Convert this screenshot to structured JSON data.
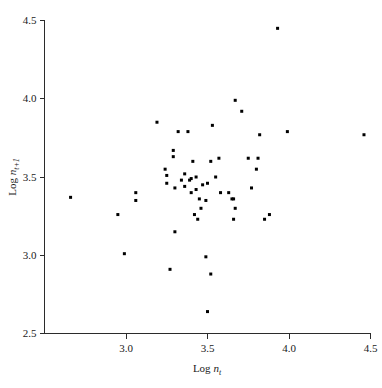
{
  "chart_data": {
    "type": "scatter",
    "title": "",
    "xlabel": "Log n_t",
    "ylabel": "Log n_t+1",
    "xlabel_parts": {
      "prefix": "Log ",
      "symbol": "n",
      "subscript": "t"
    },
    "ylabel_parts": {
      "prefix": "Log ",
      "symbol": "n",
      "subscript": "t+1"
    },
    "xlim": [
      2.5,
      4.5
    ],
    "ylim": [
      2.5,
      4.5
    ],
    "xticks": [
      "3.0",
      "3.5",
      "4.0",
      "4.5"
    ],
    "xtick_values": [
      3.0,
      3.5,
      4.0,
      4.5
    ],
    "yticks": [
      "2.5",
      "3.0",
      "3.5",
      "4.0",
      "4.5"
    ],
    "ytick_values": [
      2.5,
      3.0,
      3.5,
      4.0,
      4.5
    ],
    "grid": false,
    "legend": false,
    "marker": "square",
    "marker_color": "#000000",
    "marker_size_px": 3,
    "n_points": 57,
    "points": [
      [
        2.66,
        3.37
      ],
      [
        2.95,
        3.26
      ],
      [
        2.99,
        3.01
      ],
      [
        3.06,
        3.4
      ],
      [
        3.06,
        3.35
      ],
      [
        3.19,
        3.85
      ],
      [
        3.25,
        3.51
      ],
      [
        3.25,
        3.46
      ],
      [
        3.27,
        2.91
      ],
      [
        3.29,
        3.67
      ],
      [
        3.29,
        3.63
      ],
      [
        3.3,
        3.15
      ],
      [
        3.32,
        3.79
      ],
      [
        3.38,
        3.79
      ],
      [
        3.39,
        3.48
      ],
      [
        3.4,
        3.4
      ],
      [
        3.41,
        3.6
      ],
      [
        3.42,
        3.26
      ],
      [
        3.44,
        3.23
      ],
      [
        3.47,
        3.45
      ],
      [
        3.49,
        2.99
      ],
      [
        3.5,
        3.46
      ],
      [
        3.5,
        2.64
      ],
      [
        3.52,
        3.6
      ],
      [
        3.52,
        2.88
      ],
      [
        3.53,
        3.83
      ],
      [
        3.57,
        3.62
      ],
      [
        3.65,
        3.36
      ],
      [
        3.66,
        3.36
      ],
      [
        3.66,
        3.23
      ],
      [
        3.67,
        3.99
      ],
      [
        3.67,
        3.3
      ],
      [
        3.71,
        3.92
      ],
      [
        3.75,
        3.62
      ],
      [
        3.77,
        3.43
      ],
      [
        3.8,
        3.55
      ],
      [
        3.81,
        3.62
      ],
      [
        3.82,
        3.77
      ],
      [
        3.85,
        3.23
      ],
      [
        3.88,
        3.26
      ],
      [
        3.93,
        4.45
      ],
      [
        3.99,
        3.79
      ],
      [
        4.46,
        3.77
      ],
      [
        3.3,
        3.43
      ],
      [
        3.36,
        3.52
      ],
      [
        3.4,
        3.49
      ],
      [
        3.43,
        3.5
      ],
      [
        3.45,
        3.36
      ],
      [
        3.49,
        3.35
      ],
      [
        3.34,
        3.48
      ],
      [
        3.36,
        3.44
      ],
      [
        3.58,
        3.4
      ],
      [
        3.63,
        3.4
      ],
      [
        3.24,
        3.55
      ],
      [
        3.46,
        3.3
      ],
      [
        3.55,
        3.5
      ],
      [
        3.43,
        3.42
      ]
    ]
  },
  "axes": {
    "y_tick_labels": [
      "4.5",
      "4.0",
      "3.5",
      "3.0",
      "2.5"
    ],
    "x_tick_labels": [
      "3.0",
      "3.5",
      "4.0",
      "4.5"
    ]
  }
}
